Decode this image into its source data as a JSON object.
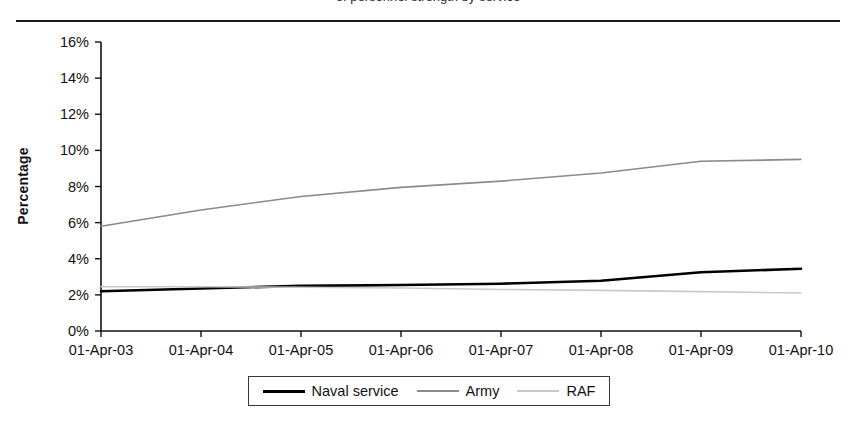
{
  "figure": {
    "caption_cutoff": "of personnel strength by service",
    "ylabel": "Percentage"
  },
  "chart_data": {
    "type": "line",
    "title": "",
    "xlabel": "",
    "ylabel": "Percentage",
    "categories": [
      "01-Apr-03",
      "01-Apr-04",
      "01-Apr-05",
      "01-Apr-06",
      "01-Apr-07",
      "01-Apr-08",
      "01-Apr-09",
      "01-Apr-10"
    ],
    "ylim": [
      0,
      16
    ],
    "yticks": [
      0,
      2,
      4,
      6,
      8,
      10,
      12,
      14,
      16
    ],
    "ytick_labels": [
      "0%",
      "2%",
      "4%",
      "6%",
      "8%",
      "10%",
      "12%",
      "14%",
      "16%"
    ],
    "grid": false,
    "legend_position": "bottom",
    "series": [
      {
        "name": "Naval service",
        "color": "#000000",
        "width": 2.6,
        "style": "solid",
        "values": [
          2.2,
          2.35,
          2.5,
          2.55,
          2.62,
          2.78,
          3.25,
          3.45
        ]
      },
      {
        "name": "Army",
        "color": "#8a8a8a",
        "width": 1.6,
        "style": "solid",
        "values": [
          5.8,
          6.7,
          7.45,
          7.95,
          8.3,
          8.75,
          9.4,
          9.5
        ]
      },
      {
        "name": "RAF",
        "color": "#c9c9c9",
        "width": 1.6,
        "style": "solid",
        "values": [
          2.45,
          2.45,
          2.42,
          2.38,
          2.3,
          2.25,
          2.18,
          2.1
        ]
      }
    ]
  },
  "legend": {
    "items": [
      {
        "label": "Naval service",
        "swatch": "naval-line-swatch"
      },
      {
        "label": "Army",
        "swatch": "army-line-swatch"
      },
      {
        "label": "RAF",
        "swatch": "raf-line-swatch"
      }
    ]
  }
}
